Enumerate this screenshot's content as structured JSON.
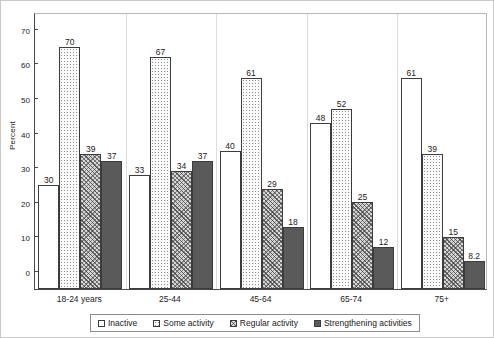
{
  "chart_data": {
    "type": "bar",
    "title": "",
    "xlabel": "",
    "ylabel": "Percent",
    "ylim": [
      0,
      80
    ],
    "yticks": [
      0,
      10,
      20,
      30,
      40,
      50,
      60,
      70,
      80
    ],
    "grid": false,
    "legend_position": "bottom",
    "categories": [
      "18-24 years",
      "25-44",
      "45-64",
      "65-74",
      "75+"
    ],
    "series": [
      {
        "name": "Inactive",
        "pattern": "open",
        "values": [
          30,
          33,
          40,
          48,
          61
        ],
        "labels": [
          "30",
          "33",
          "40",
          "48",
          "61"
        ]
      },
      {
        "name": "Some activity",
        "pattern": "dotted",
        "values": [
          70,
          67,
          61,
          52,
          39
        ],
        "labels": [
          "70",
          "67",
          "61",
          "52",
          "39"
        ]
      },
      {
        "name": "Regular activity",
        "pattern": "hatched",
        "values": [
          39,
          34,
          29,
          25,
          15
        ],
        "labels": [
          "39",
          "34",
          "29",
          "25",
          "15"
        ]
      },
      {
        "name": "Strengthening activities",
        "pattern": "solid",
        "values": [
          37,
          37,
          18,
          12,
          8.2
        ],
        "labels": [
          "37",
          "37",
          "18",
          "12",
          "8.2"
        ]
      }
    ],
    "colors": {
      "inactive": "#ffffff",
      "some_activity": "#fbfbfb",
      "regular_activity": "#d6d6d6",
      "strengthening_activities": "#5a5a5a",
      "bar_outline": "#3c3c3c",
      "axis": "#4a4a4a",
      "text": "#1a1a1a"
    }
  }
}
